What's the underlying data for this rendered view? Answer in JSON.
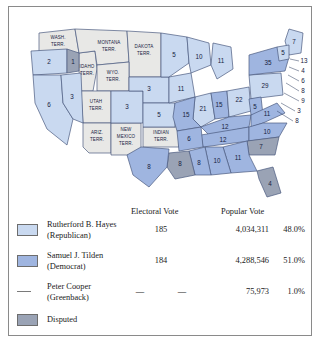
{
  "map": {
    "states": [
      {
        "name": "oregon",
        "label": "2",
        "party": "hayes"
      },
      {
        "name": "idaho-sliver",
        "label": "1",
        "party": "disputed"
      },
      {
        "name": "california",
        "label": "6",
        "party": "hayes"
      },
      {
        "name": "nevada",
        "label": "3",
        "party": "hayes"
      },
      {
        "name": "colorado",
        "label": "3",
        "party": "hayes"
      },
      {
        "name": "nebraska",
        "label": "3",
        "party": "hayes"
      },
      {
        "name": "kansas",
        "label": "5",
        "party": "hayes"
      },
      {
        "name": "minnesota",
        "label": "5",
        "party": "hayes"
      },
      {
        "name": "wisconsin",
        "label": "10",
        "party": "hayes"
      },
      {
        "name": "iowa",
        "label": "11",
        "party": "hayes"
      },
      {
        "name": "illinois",
        "label": "21",
        "party": "hayes"
      },
      {
        "name": "michigan",
        "label": "11",
        "party": "hayes"
      },
      {
        "name": "indiana",
        "label": "15",
        "party": "tilden"
      },
      {
        "name": "ohio",
        "label": "22",
        "party": "hayes"
      },
      {
        "name": "pennsylvania",
        "label": "29",
        "party": "hayes"
      },
      {
        "name": "new-york",
        "label": "35",
        "party": "tilden"
      },
      {
        "name": "maine",
        "label": "7",
        "party": "hayes"
      },
      {
        "name": "vermont",
        "label": "5",
        "party": "hayes"
      },
      {
        "name": "missouri",
        "label": "15",
        "party": "tilden"
      },
      {
        "name": "arkansas",
        "label": "6",
        "party": "tilden"
      },
      {
        "name": "texas",
        "label": "8",
        "party": "tilden"
      },
      {
        "name": "louisiana",
        "label": "8",
        "party": "disputed"
      },
      {
        "name": "mississippi",
        "label": "8",
        "party": "tilden"
      },
      {
        "name": "alabama",
        "label": "10",
        "party": "tilden"
      },
      {
        "name": "georgia",
        "label": "11",
        "party": "tilden"
      },
      {
        "name": "florida",
        "label": "4",
        "party": "disputed"
      },
      {
        "name": "south-carolina",
        "label": "7",
        "party": "disputed"
      },
      {
        "name": "north-carolina",
        "label": "10",
        "party": "tilden"
      },
      {
        "name": "virginia",
        "label": "11",
        "party": "tilden"
      },
      {
        "name": "west-virginia",
        "label": "5",
        "party": "tilden"
      },
      {
        "name": "kentucky",
        "label": "12",
        "party": "tilden"
      },
      {
        "name": "tennessee",
        "label": "12",
        "party": "tilden"
      }
    ],
    "leader_states": [
      {
        "name": "new-hampshire",
        "label": "13"
      },
      {
        "name": "massachusetts",
        "label": "4"
      },
      {
        "name": "rhode-island",
        "label": "6"
      },
      {
        "name": "connecticut",
        "label": "8"
      },
      {
        "name": "new-jersey",
        "label": "9"
      },
      {
        "name": "delaware",
        "label": "3"
      },
      {
        "name": "maryland",
        "label": "8"
      }
    ],
    "territories": [
      {
        "name": "washington-territory",
        "line1": "WASH.",
        "line2": "TERR.",
        "line3": ""
      },
      {
        "name": "idaho-territory",
        "line1": "IDAHO",
        "line2": "TERR.",
        "line3": ""
      },
      {
        "name": "montana-territory",
        "line1": "MONTANA",
        "line2": "TERR.",
        "line3": ""
      },
      {
        "name": "dakota-territory",
        "line1": "DAKOTA",
        "line2": "TERR.",
        "line3": ""
      },
      {
        "name": "wyoming-territory",
        "line1": "WYO.",
        "line2": "TERR.",
        "line3": ""
      },
      {
        "name": "utah-territory",
        "line1": "UTAH",
        "line2": "TERR.",
        "line3": ""
      },
      {
        "name": "arizona-territory",
        "line1": "ARIZ.",
        "line2": "TERR.",
        "line3": ""
      },
      {
        "name": "new-mexico-territory",
        "line1": "NEW",
        "line2": "MEXICO",
        "line3": "TERR."
      },
      {
        "name": "indian-territory",
        "line1": "INDIAN",
        "line2": "TERR.",
        "line3": ""
      }
    ],
    "colors": {
      "hayes": "#c9d9f0",
      "tilden": "#9fb5e0",
      "disputed": "#9aa3b5",
      "territory": "#e8e8e6",
      "border": "#4a5a80"
    }
  },
  "table": {
    "headers": {
      "electoral": "Electoral Vote",
      "popular": "Popular Vote"
    },
    "rows": [
      {
        "key": "hayes",
        "swatch": "#c9d9f0",
        "name_line1": "Rutherford B. Hayes",
        "name_line2": "(Republican)",
        "electoral": "185",
        "electoral_2": "",
        "popular": "4,034,311",
        "percent": "48.0%"
      },
      {
        "key": "tilden",
        "swatch": "#9fb5e0",
        "name_line1": "Samuel J. Tilden",
        "name_line2": "(Democrat)",
        "electoral": "184",
        "electoral_2": "",
        "popular": "4,288,546",
        "percent": "51.0%"
      },
      {
        "key": "cooper",
        "swatch": "",
        "name_line1": "Peter Cooper",
        "name_line2": "(Greenback)",
        "electoral": "—",
        "electoral_2": "—",
        "popular": "75,973",
        "percent": "1.0%"
      }
    ],
    "disputed": {
      "swatch": "#9aa3b5",
      "label": "Disputed"
    }
  }
}
